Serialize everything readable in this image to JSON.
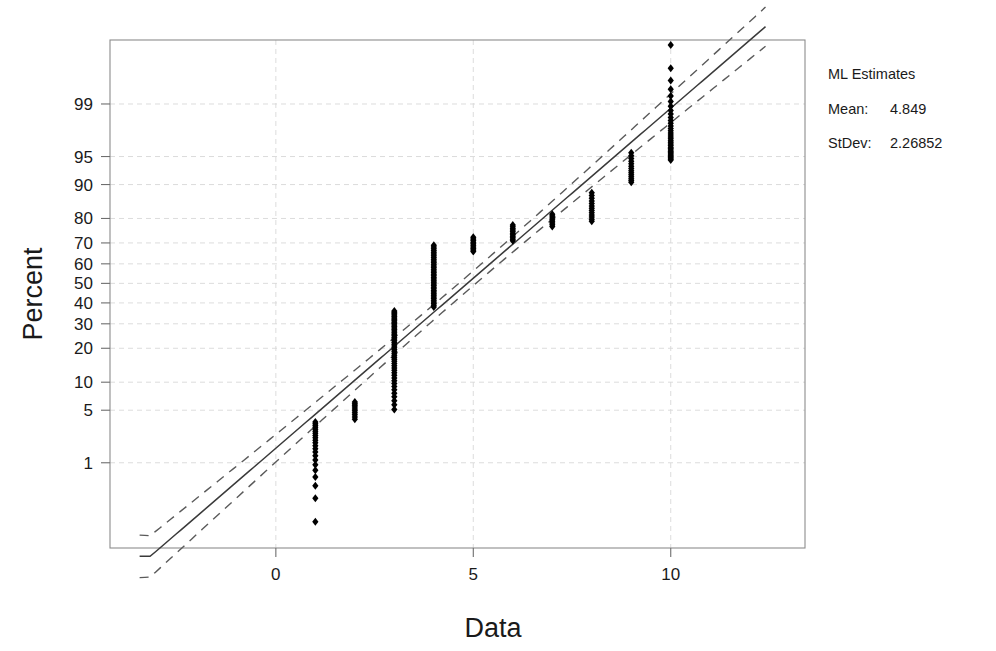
{
  "chart_data": {
    "type": "scatter",
    "title": "",
    "subtitle": "",
    "xlabel": "Data",
    "ylabel": "Percent",
    "grid": true,
    "xlim": [
      -4.2,
      13.4
    ],
    "xticks": [
      0,
      5,
      10
    ],
    "xtick_labels": [
      "0",
      "5",
      "10"
    ],
    "yscale": "normal-probability",
    "yticks": [
      1,
      5,
      10,
      20,
      30,
      40,
      50,
      60,
      70,
      80,
      90,
      95,
      99
    ],
    "ytick_labels": [
      "1",
      "5",
      "10",
      "20",
      "30",
      "40",
      "50",
      "60",
      "70",
      "80",
      "90",
      "95",
      "99"
    ],
    "ylim_percent": [
      0.03,
      99.92
    ],
    "point_marker": "diamond",
    "point_color": "#000000",
    "series": [
      {
        "name": "Sample percentiles",
        "description": "Cumulative percent plotted against integer data values 1 through 10",
        "columns": [
          {
            "x": 1,
            "percent_min": 0.1,
            "percent_max": 3.6,
            "n": 22
          },
          {
            "x": 2,
            "percent_min": 3.9,
            "percent_max": 6.2,
            "n": 10
          },
          {
            "x": 3,
            "percent_min": 5.1,
            "percent_max": 36.0,
            "n": 48
          },
          {
            "x": 4,
            "percent_min": 38.0,
            "percent_max": 69.0,
            "n": 38
          },
          {
            "x": 5,
            "percent_min": 66.0,
            "percent_max": 72.5,
            "n": 10
          },
          {
            "x": 6,
            "percent_min": 71.0,
            "percent_max": 77.5,
            "n": 11
          },
          {
            "x": 7,
            "percent_min": 77.0,
            "percent_max": 81.5,
            "n": 8
          },
          {
            "x": 8,
            "percent_min": 79.0,
            "percent_max": 88.0,
            "n": 13
          },
          {
            "x": 9,
            "percent_min": 90.5,
            "percent_max": 95.5,
            "n": 14
          },
          {
            "x": 10,
            "percent_min": 94.5,
            "percent_max": 99.9,
            "n": 34
          }
        ]
      }
    ],
    "fit_line": {
      "name": "Normal fit line",
      "style": "solid",
      "mean": 4.849,
      "stdev": 2.26852
    },
    "confidence_bands": {
      "name": "95% confidence interval",
      "style": "dashed",
      "count": 2
    }
  },
  "legend": {
    "title": "ML Estimates",
    "rows": [
      {
        "key": "Mean:",
        "value": "4.849"
      },
      {
        "key": "StDev:",
        "value": "2.26852"
      }
    ]
  },
  "colors": {
    "point": "#000000",
    "fit_line": "#3a3a3a",
    "confidence_band": "#5a5a5a",
    "grid": "#d8d8d8",
    "frame": "#8c8c8c",
    "text": "#1a1a1a",
    "background": "#ffffff"
  }
}
